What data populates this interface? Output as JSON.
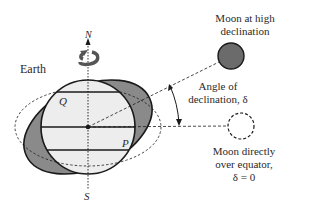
{
  "labels": {
    "earth": "Earth",
    "north": "N",
    "south": "S",
    "point_q": "Q",
    "point_p": "P",
    "moon_high_line1": "Moon at high",
    "moon_high_line2": "declination",
    "angle_line1": "Angle of",
    "angle_line2": "declination, δ",
    "moon_eq_line1": "Moon directly",
    "moon_eq_line2": "over equator,",
    "moon_eq_line3": "δ = 0"
  },
  "colors": {
    "bulge_fill": "#8a8a8a",
    "earth_fill": "#ededed",
    "moon_high_fill": "#6b6b6b",
    "stroke": "#1a1a1a"
  },
  "geometry": {
    "earth_center": [
      88,
      127
    ],
    "earth_radius": 47,
    "tilted_bulge": {
      "rx": 68,
      "ry": 41,
      "rotation_deg": -25
    },
    "equilibrium_bulge_dashed": {
      "rx": 73,
      "ry": 39
    },
    "moon_high": {
      "cx": 231,
      "cy": 56,
      "r": 13
    },
    "moon_equator": {
      "cx": 241,
      "cy": 126,
      "r": 13
    }
  }
}
